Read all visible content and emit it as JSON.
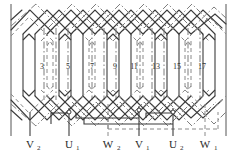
{
  "diagram": {
    "type": "winding-developed-diagram",
    "colors": {
      "solid_line": "#3b3b3b",
      "dashed_line": "#8a8a8a",
      "dashdot_line": "#7d7d7d",
      "frame_line": "#555555",
      "background": "#ffffff"
    },
    "slot_numbers": [
      "3",
      "5",
      "7",
      "9",
      "11",
      "13",
      "15",
      "17"
    ],
    "slot_number_x": [
      42,
      68,
      92,
      115,
      134,
      156,
      177,
      202
    ],
    "slot_number_y": 66,
    "terminals": [
      {
        "base": "V",
        "sub": "2",
        "x": 30,
        "lead_x": 30,
        "lead_top": 112
      },
      {
        "base": "U",
        "sub": "1",
        "x": 69,
        "lead_x": 69,
        "lead_top": 108
      },
      {
        "base": "W",
        "sub": "2",
        "x": 108,
        "lead_x": 108,
        "lead_top": 104
      },
      {
        "base": "V",
        "sub": "1",
        "x": 139,
        "lead_x": 139,
        "lead_top": 106
      },
      {
        "base": "U",
        "sub": "2",
        "x": 173,
        "lead_x": 173,
        "lead_top": 108
      },
      {
        "base": "W",
        "sub": "1",
        "x": 205,
        "lead_x": 205,
        "lead_top": 104
      }
    ],
    "terminal_label_y": 145,
    "frame": {
      "left_x": 11,
      "right_x": 226,
      "top_y": 4,
      "bottom_y": 136
    },
    "coil_groups": [
      {
        "phase": "U",
        "style": "solid"
      },
      {
        "phase": "V",
        "style": "dashed"
      },
      {
        "phase": "W",
        "style": "dashdot"
      }
    ],
    "coil_x_positions": [
      30,
      54,
      78,
      102,
      126,
      150,
      174,
      198,
      222
    ],
    "coil_band": {
      "top_y": 36,
      "bottom_y": 96
    }
  }
}
